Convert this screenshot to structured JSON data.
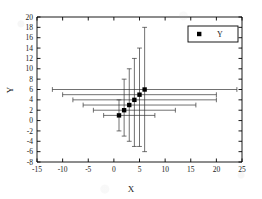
{
  "chart_data": {
    "type": "scatter",
    "title": "",
    "xlabel": "X",
    "ylabel": "Y",
    "xlim": [
      -15,
      25
    ],
    "ylim": [
      -8,
      20
    ],
    "xticks": [
      -15,
      -10,
      -5,
      0,
      5,
      10,
      15,
      20,
      25
    ],
    "yticks": [
      -8,
      -6,
      -4,
      -2,
      0,
      2,
      4,
      6,
      8,
      10,
      12,
      14,
      16,
      18,
      20
    ],
    "grid": false,
    "legend": {
      "position": "top-right",
      "entries": [
        {
          "label": "Y",
          "marker": "filled-square",
          "color": "#000000"
        }
      ]
    },
    "series": [
      {
        "name": "Y",
        "marker": "filled-square",
        "color": "#000000",
        "points": [
          {
            "x": 1,
            "y": 1,
            "xerr_low": -2,
            "xerr_high": 8,
            "yerr_low": -2,
            "yerr_high": 4
          },
          {
            "x": 2,
            "y": 2,
            "xerr_low": -4,
            "xerr_high": 12,
            "yerr_low": -3,
            "yerr_high": 8
          },
          {
            "x": 3,
            "y": 3,
            "xerr_low": -6,
            "xerr_high": 16,
            "yerr_low": -4,
            "yerr_high": 10
          },
          {
            "x": 4,
            "y": 4,
            "xerr_low": -8,
            "xerr_high": 20,
            "yerr_low": -5,
            "yerr_high": 12
          },
          {
            "x": 5,
            "y": 5,
            "xerr_low": -10,
            "xerr_high": 20,
            "yerr_low": -5,
            "yerr_high": 14
          },
          {
            "x": 6,
            "y": 6,
            "xerr_low": -12,
            "xerr_high": 24,
            "yerr_low": -6,
            "yerr_high": 18
          }
        ]
      }
    ]
  },
  "axis_style": {
    "line_color": "#000000",
    "tick_color": "#000000",
    "text_color": "#1a1a1a",
    "error_bar_color": "#333333"
  }
}
